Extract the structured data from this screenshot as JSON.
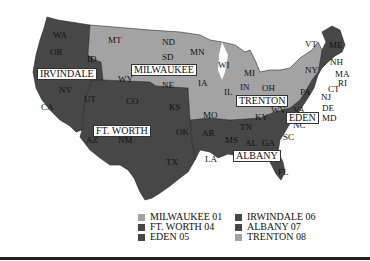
{
  "colors": {
    "light": "#a3a3a3",
    "dark": "#474747",
    "border": "#2a2a2a"
  },
  "map": {
    "region_labels": [
      {
        "id": "irvindale",
        "text": "IRVINDALE"
      },
      {
        "id": "milwaukee",
        "text": "MILWAUKEE"
      },
      {
        "id": "ft_worth",
        "text": "FT. WORTH"
      },
      {
        "id": "trenton",
        "text": "TRENTON"
      },
      {
        "id": "eden",
        "text": "EDEN"
      },
      {
        "id": "albany",
        "text": "ALBANY"
      }
    ],
    "state_labels": [
      "WA",
      "OR",
      "ID",
      "CA",
      "NV",
      "UT",
      "AZ",
      "MT",
      "WY",
      "CO",
      "NM",
      "ND",
      "SD",
      "NE",
      "KS",
      "OK",
      "TX",
      "MN",
      "IA",
      "MO",
      "AR",
      "LA",
      "WI",
      "IL",
      "MI",
      "IN",
      "OH",
      "KY",
      "TN",
      "MS",
      "AL",
      "GA",
      "FL",
      "SC",
      "NC",
      "VA",
      "WV",
      "PA",
      "NY",
      "VT",
      "ME",
      "NH",
      "MA",
      "RI",
      "CT",
      "NJ",
      "DE",
      "MD"
    ]
  },
  "legend": {
    "items": [
      {
        "label": "MILWAUKEE 01",
        "shade": "light"
      },
      {
        "label": "FT. WORTH 04",
        "shade": "dark"
      },
      {
        "label": "EDEN 05",
        "shade": "dark"
      },
      {
        "label": "IRWINDALE 06",
        "shade": "dark"
      },
      {
        "label": "ALBANY 07",
        "shade": "dark"
      },
      {
        "label": "TRENTON 08",
        "shade": "light"
      }
    ]
  }
}
